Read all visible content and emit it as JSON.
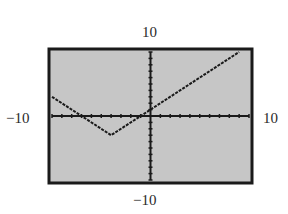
{
  "chart_data": {
    "type": "line",
    "title": "",
    "xlabel": "",
    "ylabel": "",
    "xlim": [
      -10,
      10
    ],
    "ylim": [
      -10,
      10
    ],
    "window_labels": {
      "ymax": "10",
      "ymin": "−10",
      "xmin": "−10",
      "xmax": "10"
    },
    "x_ticks_per_side": 10,
    "y_ticks_per_side": 10,
    "grid": false,
    "series": [
      {
        "name": "f(x)",
        "x": [
          -10,
          -4,
          0,
          9
        ],
        "y": [
          3,
          -3,
          1,
          10
        ]
      }
    ],
    "style": {
      "screen_color": "#c8c8c8",
      "frame_color": "#1a1a1a",
      "curve_color": "#1a1a1a",
      "axis_color": "#1a1a1a"
    }
  }
}
